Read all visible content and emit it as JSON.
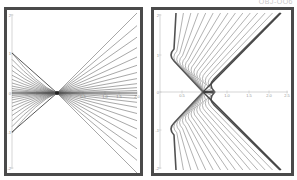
{
  "caption": "OBJ-OO6",
  "chart_data": [
    {
      "type": "line",
      "title": "",
      "xlabel": "",
      "ylabel": "",
      "xlim": [
        0,
        2.0
      ],
      "ylim": [
        -2,
        2
      ],
      "x_ticks": [
        "0.5",
        "1.0",
        "1.5",
        "2.0"
      ],
      "y_ticks": [
        "2",
        "1",
        "0",
        "-1",
        "-2"
      ],
      "grid": false,
      "description": "Family of lines converging at a single point (~x=0.7, y=0) from left and fanning out linearly to the right, symmetric above and below the x-axis",
      "convergence_point": [
        0.7,
        0
      ],
      "series_count": 24
    },
    {
      "type": "line",
      "title": "",
      "xlabel": "",
      "ylabel": "",
      "xlim": [
        0,
        2.5
      ],
      "ylim": [
        -2,
        2
      ],
      "x_ticks": [
        "0.5",
        "1.0",
        "1.5",
        "2.0",
        "2.5"
      ],
      "y_ticks": [
        "2",
        "1",
        "0",
        "-1",
        "-2"
      ],
      "grid": false,
      "description": "Two mirrored families of curves forming a V/chevron shape; vertex at ~x=0.8, y=0; upper family bends near x~0.2, y~1 and rises linearly to the top, lower family mirrored below",
      "vertex": [
        0.8,
        0
      ],
      "series_count": 30
    }
  ]
}
